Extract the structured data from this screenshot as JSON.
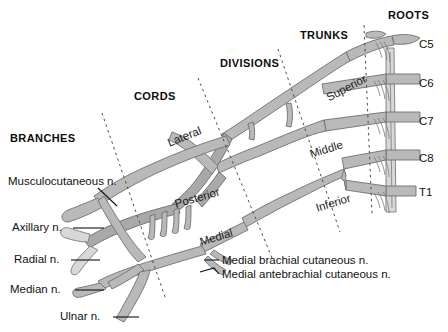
{
  "figure": {
    "background_color": "#ffffff",
    "nerve_fill": "#b9b9b9",
    "nerve_fill_light": "#d6d6d6",
    "nerve_stroke": "#6e6e6e",
    "text_color": "#111111",
    "divider_color": "#555555"
  },
  "section_headers": [
    {
      "label": "BRANCHES",
      "x": 10,
      "y": 138
    },
    {
      "label": "CORDS",
      "x": 134,
      "y": 96
    },
    {
      "label": "DIVISIONS",
      "x": 220,
      "y": 62
    },
    {
      "label": "TRUNKS",
      "x": 300,
      "y": 34
    },
    {
      "label": "ROOTS",
      "x": 388,
      "y": 14
    }
  ],
  "roots": [
    {
      "label": "C5",
      "x": 419,
      "y": 38
    },
    {
      "label": "C6",
      "x": 419,
      "y": 77
    },
    {
      "label": "C7",
      "x": 419,
      "y": 115
    },
    {
      "label": "C8",
      "x": 419,
      "y": 152
    },
    {
      "label": "T1",
      "x": 419,
      "y": 186
    }
  ],
  "trunks": [
    {
      "label": "Superior",
      "x": 327,
      "y": 92,
      "rotation": -28
    },
    {
      "label": "Middle",
      "x": 310,
      "y": 148,
      "rotation": -17
    },
    {
      "label": "Inferior",
      "x": 316,
      "y": 202,
      "rotation": -17
    }
  ],
  "cords": [
    {
      "label": "Lateral",
      "x": 168,
      "y": 137,
      "rotation": -22
    },
    {
      "label": "Posterior",
      "x": 175,
      "y": 198,
      "rotation": -16
    },
    {
      "label": "Medial",
      "x": 200,
      "y": 236,
      "rotation": -17
    }
  ],
  "branches": [
    {
      "label": "Musculocutaneous n.",
      "x": 8,
      "y": 181
    },
    {
      "label": "Axillary n.",
      "x": 12,
      "y": 224
    },
    {
      "label": "Radial n.",
      "x": 14,
      "y": 256
    },
    {
      "label": "Median n.",
      "x": 10,
      "y": 286
    },
    {
      "label": "Ulnar n.",
      "x": 60,
      "y": 313
    }
  ],
  "cutaneous_nerves": [
    {
      "label": "Medial brachial cutaneous n.",
      "x": 222,
      "y": 257
    },
    {
      "label": "Medial antebrachial cutaneous n.",
      "x": 222,
      "y": 271
    }
  ],
  "dividers": [
    {
      "name": "branches-cords-divider",
      "x1": 102,
      "y1": 113,
      "x2": 165,
      "y2": 297
    },
    {
      "name": "cords-divisions-divider",
      "x1": 198,
      "y1": 78,
      "x2": 272,
      "y2": 258
    },
    {
      "name": "divisions-trunks-divider",
      "x1": 278,
      "y1": 49,
      "x2": 340,
      "y2": 232
    },
    {
      "name": "trunks-roots-divider",
      "x1": 364,
      "y1": 25,
      "x2": 372,
      "y2": 214
    }
  ]
}
